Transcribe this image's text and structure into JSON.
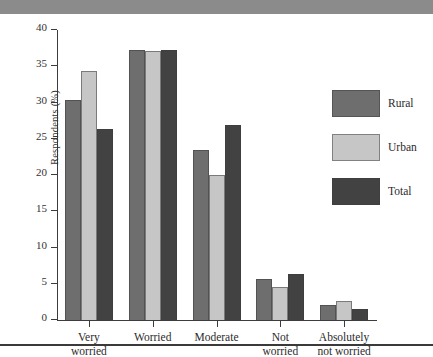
{
  "chart_data": {
    "type": "bar",
    "title": "",
    "xlabel": "",
    "ylabel": "Respondents (%)",
    "ylim": [
      0,
      40
    ],
    "yticks": [
      0,
      5,
      10,
      15,
      20,
      25,
      30,
      35,
      40
    ],
    "ytick_labels": [
      "0",
      "5",
      "10",
      "15",
      "20",
      "25",
      "30",
      "35",
      "40"
    ],
    "grid": false,
    "legend_position": "right",
    "categories": [
      "Very\nworried",
      "Worried",
      "Moderate",
      "Not\nworried",
      "Absolutely\nnot worried"
    ],
    "series": [
      {
        "name": "Rural",
        "color": "#6e6e6e",
        "values": [
          30.3,
          37.3,
          23.5,
          5.6,
          2.1
        ]
      },
      {
        "name": "Urban",
        "color": "#c6c6c6",
        "values": [
          34.3,
          37.1,
          20.0,
          4.6,
          2.6
        ]
      },
      {
        "name": "Total",
        "color": "#424242",
        "values": [
          26.3,
          37.3,
          26.9,
          6.4,
          1.5
        ]
      }
    ]
  },
  "legend": {
    "items": [
      {
        "label": "Rural"
      },
      {
        "label": "Urban"
      },
      {
        "label": "Total"
      }
    ]
  }
}
